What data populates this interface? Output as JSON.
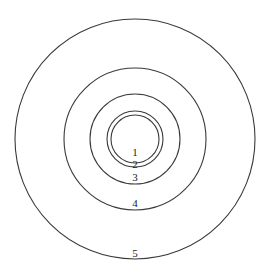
{
  "diagram": {
    "type": "concentric-circles",
    "center": {
      "x": 135,
      "y": 139
    },
    "stroke_color": "#3a3a3a",
    "background": "#ffffff",
    "rings": [
      {
        "label": "1",
        "radius": 24,
        "label_y": 156
      },
      {
        "label": "2",
        "radius": 28,
        "label_y": 168
      },
      {
        "label": "3",
        "radius": 45,
        "label_y": 181
      },
      {
        "label": "4",
        "radius": 71,
        "label_y": 207
      },
      {
        "label": "5",
        "radius": 120,
        "label_y": 257
      }
    ]
  }
}
